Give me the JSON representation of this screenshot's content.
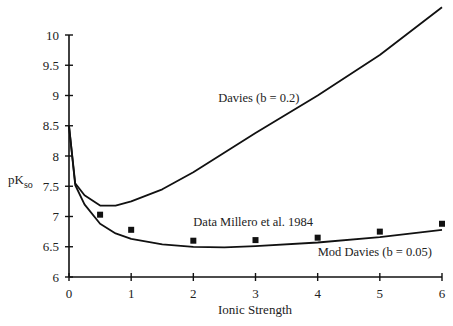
{
  "chart_data": {
    "type": "line",
    "title": "",
    "xlabel": "Ionic Strength",
    "ylabel": "pK",
    "ylabel_subscript": "so",
    "xlim": [
      0,
      6
    ],
    "ylim": [
      6,
      10
    ],
    "x_ticks": [
      "0",
      "1",
      "2",
      "3",
      "4",
      "5",
      "6"
    ],
    "y_ticks": [
      "6",
      "6.5",
      "7",
      "7.5",
      "8",
      "8.5",
      "9",
      "9.5",
      "10"
    ],
    "grid": false,
    "legend": "none (inline annotations)",
    "series": [
      {
        "name": "Davies (b = 0.2)",
        "kind": "line",
        "x": [
          0,
          0.1,
          0.25,
          0.5,
          0.75,
          1,
          1.5,
          2,
          3,
          4,
          5,
          6
        ],
        "y": [
          8.5,
          7.55,
          7.35,
          7.18,
          7.18,
          7.25,
          7.45,
          7.73,
          8.38,
          9.0,
          9.67,
          10.46
        ]
      },
      {
        "name": "Mod Davies (b = 0.05)",
        "kind": "line",
        "x": [
          0,
          0.1,
          0.25,
          0.5,
          0.75,
          1,
          1.5,
          2,
          2.5,
          3,
          4,
          5,
          6
        ],
        "y": [
          8.5,
          7.52,
          7.2,
          6.88,
          6.72,
          6.63,
          6.54,
          6.5,
          6.49,
          6.51,
          6.57,
          6.66,
          6.78
        ]
      },
      {
        "name": "Data Millero et al. 1984",
        "kind": "scatter",
        "x": [
          0.5,
          1,
          2,
          3,
          4,
          5,
          6
        ],
        "y": [
          7.03,
          6.78,
          6.6,
          6.61,
          6.65,
          6.75,
          6.88
        ]
      }
    ],
    "annotations": [
      {
        "text": "Davies (b = 0.2)",
        "x": 2.4,
        "y": 8.9
      },
      {
        "text": "Data Millero et al. 1984",
        "x": 2.0,
        "y": 6.85
      },
      {
        "text": "Mod Davies (b = 0.05)",
        "x": 4.0,
        "y": 6.35
      }
    ]
  }
}
